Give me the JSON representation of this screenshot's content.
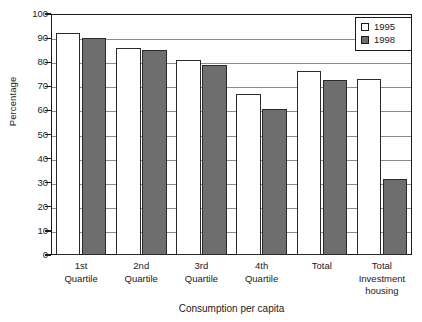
{
  "chart_data": {
    "type": "bar",
    "title": "",
    "xlabel": "Consumption per capita",
    "ylabel": "Percentage",
    "ylim": [
      0,
      100
    ],
    "ytick_step": 10,
    "yticks": [
      0,
      10,
      20,
      30,
      40,
      50,
      60,
      70,
      80,
      90,
      100
    ],
    "grid": true,
    "grid_axis": "y",
    "legend_position": "top-right",
    "categories": [
      "1st\nQuartile",
      "2nd\nQuartile",
      "3rd\nQuartile",
      "4th\nQuartile",
      "Total",
      "Total\nInvestment\nhousing"
    ],
    "category_lines": [
      [
        "1st",
        "Quartile"
      ],
      [
        "2nd",
        "Quartile"
      ],
      [
        "3rd",
        "Quartile"
      ],
      [
        "4th",
        "Quartile"
      ],
      [
        "Total"
      ],
      [
        "Total",
        "Investment",
        "housing"
      ]
    ],
    "series": [
      {
        "name": "1995",
        "color": "#ffffff",
        "values": [
          92,
          86,
          81,
          67,
          76.5,
          73
        ]
      },
      {
        "name": "1998",
        "color": "#6e6e6e",
        "values": [
          90,
          85,
          79,
          60.5,
          72.5,
          31.5
        ]
      }
    ]
  },
  "legend": {
    "entries": [
      {
        "label": "1995",
        "swatch": "white-square-icon"
      },
      {
        "label": "1998",
        "swatch": "gray-square-icon"
      }
    ]
  },
  "axes": {
    "y_title": "Percentage",
    "x_title": "Consumption per capita"
  },
  "colors": {
    "series_1995": "#ffffff",
    "series_1998": "#6e6e6e",
    "axis": "#1a1a1a",
    "gridline": "#8d8d8d",
    "background": "#ffffff"
  }
}
